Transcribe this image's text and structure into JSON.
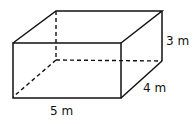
{
  "diagram": {
    "type": "rectangular-prism",
    "dimensions": {
      "length_label": "5 m",
      "width_label": "4 m",
      "height_label": "3 m"
    },
    "colors": {
      "stroke": "#111111",
      "background": "#ffffff"
    }
  }
}
